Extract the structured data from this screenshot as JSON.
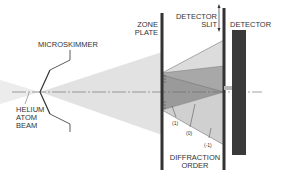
{
  "diagram": {
    "labels": {
      "microskimmer": "MICROSKIMMER",
      "helium_line1": "HELIUM",
      "helium_line2": "ATOM",
      "helium_line3": "BEAM",
      "zone_line1": "ZONE",
      "zone_line2": "PLATE",
      "slit_line1": "DETECTOR",
      "slit_line2": "SLIT",
      "detector": "DETECTOR",
      "diffraction_line1": "DIFFRACTION",
      "diffraction_line2": "ORDER",
      "order_plus1": "(1)",
      "order_zero": "(0)",
      "order_minus1": "(-1)"
    },
    "colors": {
      "beam_fill": "#e4e4e4",
      "order1_fill": "#b8b8b8",
      "order0_fill": "#9a9a9a",
      "orderm1_fill": "#d2d2d2",
      "bars": "#333333",
      "detector": "#3a3a3a"
    }
  }
}
